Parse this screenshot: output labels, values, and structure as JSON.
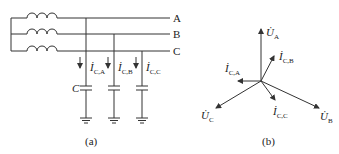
{
  "diagram": {
    "panel_a": {
      "caption": "(a)",
      "phase_labels": [
        "A",
        "B",
        "C"
      ],
      "capacitor_label": "C",
      "currents": [
        {
          "main": "İ",
          "sub": "C,A"
        },
        {
          "main": "İ",
          "sub": "C,B"
        },
        {
          "main": "İ",
          "sub": "C,C"
        }
      ]
    },
    "panel_b": {
      "caption": "(b)",
      "voltages": [
        {
          "main": "U̇",
          "sub": "A"
        },
        {
          "main": "U̇",
          "sub": "B"
        },
        {
          "main": "U̇",
          "sub": "C"
        }
      ],
      "currents": [
        {
          "main": "İ",
          "sub": "C,A"
        },
        {
          "main": "İ",
          "sub": "C,B"
        },
        {
          "main": "İ",
          "sub": "C,C"
        }
      ]
    },
    "line_color": "#333333"
  }
}
